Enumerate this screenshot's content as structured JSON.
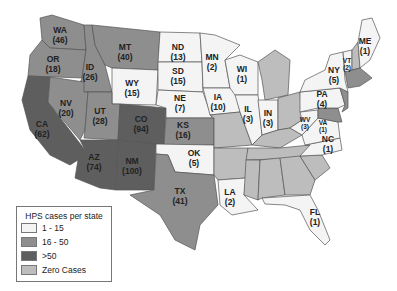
{
  "colors": {
    "range_1_15": "#f4f4f4",
    "range_16_50": "#8e8e8e",
    "range_gt50": "#5e5e5e",
    "zero": "#bdbdbd",
    "border": "#555555"
  },
  "legend": {
    "title": "HPS cases per state",
    "items": [
      {
        "label": "1 - 15",
        "color": "#f4f4f4"
      },
      {
        "label": "16 - 50",
        "color": "#8e8e8e"
      },
      {
        "label": ">50",
        "color": "#5e5e5e"
      },
      {
        "label": "Zero Cases",
        "color": "#bdbdbd"
      }
    ]
  },
  "states": [
    {
      "abbr": "WA",
      "count": "(46)"
    },
    {
      "abbr": "OR",
      "count": "(18)"
    },
    {
      "abbr": "CA",
      "count": "(62)"
    },
    {
      "abbr": "ID",
      "count": "(26)"
    },
    {
      "abbr": "NV",
      "count": "(20)"
    },
    {
      "abbr": "MT",
      "count": "(40)"
    },
    {
      "abbr": "WY",
      "count": "(15)"
    },
    {
      "abbr": "UT",
      "count": "(28)"
    },
    {
      "abbr": "CO",
      "count": "(94)"
    },
    {
      "abbr": "AZ",
      "count": "(74)"
    },
    {
      "abbr": "NM",
      "count": "(100)"
    },
    {
      "abbr": "ND",
      "count": "(13)"
    },
    {
      "abbr": "SD",
      "count": "(15)"
    },
    {
      "abbr": "NE",
      "count": "(7)"
    },
    {
      "abbr": "KS",
      "count": "(16)"
    },
    {
      "abbr": "OK",
      "count": "(5)"
    },
    {
      "abbr": "TX",
      "count": "(41)"
    },
    {
      "abbr": "MN",
      "count": "(2)"
    },
    {
      "abbr": "IA",
      "count": "(10)"
    },
    {
      "abbr": "WI",
      "count": "(1)"
    },
    {
      "abbr": "IL",
      "count": "(3)"
    },
    {
      "abbr": "IN",
      "count": "(3)"
    },
    {
      "abbr": "LA",
      "count": "(2)"
    },
    {
      "abbr": "NY",
      "count": "(5)"
    },
    {
      "abbr": "VT",
      "count": "(2)"
    },
    {
      "abbr": "ME",
      "count": "(1)"
    },
    {
      "abbr": "PA",
      "count": "(4)"
    },
    {
      "abbr": "WV",
      "count": "(3)"
    },
    {
      "abbr": "VA",
      "count": "(1)"
    },
    {
      "abbr": "NC",
      "count": "(1)"
    },
    {
      "abbr": "FL",
      "count": "(1)"
    }
  ]
}
